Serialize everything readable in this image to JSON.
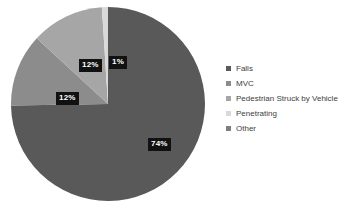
{
  "chart_data": {
    "type": "pie",
    "title": "",
    "subtitle": "",
    "xlabel": "",
    "ylabel": "",
    "grid": false,
    "legend_position": "right",
    "start_angle_deg": 0,
    "direction": "clockwise",
    "categories": [
      "Falls",
      "MVC",
      "Pedestrian Struck by Vehicle",
      "Penetrating",
      "Other"
    ],
    "values": [
      74,
      12,
      12,
      1,
      0
    ],
    "value_unit": "%",
    "data_labels": [
      "74%",
      "12%",
      "12%",
      "1%",
      ""
    ],
    "data_labels_visible": [
      true,
      true,
      true,
      true,
      false
    ],
    "colors": [
      "#595959",
      "#8c8c8c",
      "#a6a6a6",
      "#d9d9d9",
      "#7f7f7f"
    ],
    "slices": [
      {
        "label": "Falls",
        "value": 74,
        "display": "74%",
        "color": "#595959"
      },
      {
        "label": "MVC",
        "value": 12,
        "display": "12%",
        "color": "#8c8c8c"
      },
      {
        "label": "Pedestrian Struck by Vehicle",
        "value": 12,
        "display": "12%",
        "color": "#a6a6a6"
      },
      {
        "label": "Penetrating",
        "value": 1,
        "display": "1%",
        "color": "#d9d9d9"
      },
      {
        "label": "Other",
        "value": 0,
        "display": "",
        "color": "#7f7f7f"
      }
    ]
  },
  "labels": {
    "falls": "74%",
    "mvc": "12%",
    "pedestrian": "12%",
    "penetrating": "1%"
  },
  "legend": {
    "items": [
      {
        "label": "Falls",
        "color": "#595959"
      },
      {
        "label": "MVC",
        "color": "#8c8c8c"
      },
      {
        "label": "Pedestrian Struck by Vehicle",
        "color": "#a6a6a6"
      },
      {
        "label": "Penetrating",
        "color": "#d9d9d9"
      },
      {
        "label": "Other",
        "color": "#7f7f7f"
      }
    ]
  }
}
